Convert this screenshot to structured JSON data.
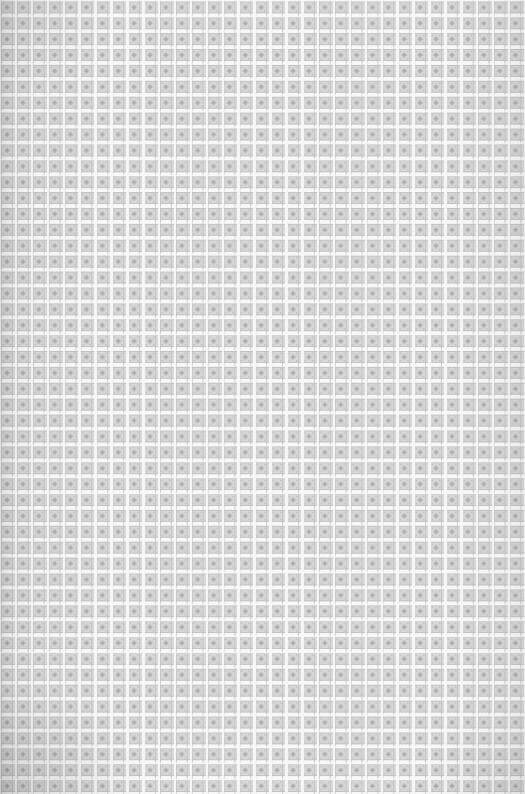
{
  "image": {
    "kind": "seamless-ornamental-tile-texture",
    "subject": "repeating decorative lattice / woven textile pattern",
    "width_px": 525,
    "height_px": 794,
    "has_text": false,
    "has_ui_chrome": false,
    "alt_text": "A seamless light gray ornamental pattern of small square tiles, each containing a four-pointed star motif, separated by white grid lines."
  },
  "pattern": {
    "tile_period_px": 15.9,
    "columns": 33,
    "rows": 50,
    "motif_name": "four-pointed-star-in-square-frame",
    "gutter_width_px": 2.5,
    "gutter_height_px": 1.7,
    "block_inset_px": 1.7,
    "frame_stroke_px": 1.0,
    "corner_accent_count": 4,
    "symmetry": "4-fold rotational, mirror on both axes",
    "repeat": "both axes"
  },
  "colors": {
    "ground": "#f3f3f3",
    "tile_fill": "#dcdcdc",
    "frame_stroke": "#c2c2c2",
    "motif_dark": "#a9a9a9",
    "motif_mid": "#bcbcbc",
    "corner_accent": "#b4b4b4",
    "gutter": "#ffffff",
    "vignette_shadow": "#787878"
  },
  "finish": {
    "grain_opacity": 0.42,
    "vignette_edges": [
      "left",
      "bottom-left",
      "bottom-right",
      "top-left"
    ],
    "blend_mode": "multiply"
  }
}
